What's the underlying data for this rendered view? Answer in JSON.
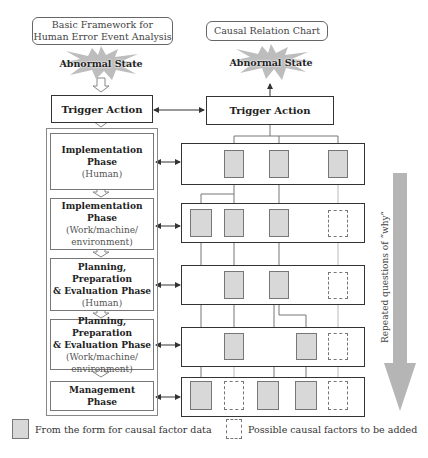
{
  "left_column": {
    "title": "Basic Framework for Human Error Event Analysis",
    "title_line1": "Basic Framework for",
    "title_line2": "Human Error Event Analysis",
    "abnormal_state": "Abnormal State",
    "trigger_action": "Trigger Action",
    "phases": [
      {
        "bold1": "Implementation",
        "bold2": "Phase",
        "normal1": "(Human)",
        "normal2": ""
      },
      {
        "bold1": "Implementation Phase",
        "bold2": "",
        "normal1": "(Work/machine/",
        "normal2": "environment)"
      },
      {
        "bold1": "Planning, Preparation",
        "bold2": "& Evaluation Phase",
        "normal1": "(Human)",
        "normal2": ""
      },
      {
        "bold1": "Planning, Preparation",
        "bold2": "& Evaluation Phase",
        "normal1": "(Work/machine/",
        "normal2": "environment)"
      },
      {
        "bold1": "Management",
        "bold2": "Phase",
        "normal1": "",
        "normal2": ""
      }
    ]
  },
  "right_column": {
    "title": "Causal Relation Chart",
    "abnormal_state": "Abnormal State",
    "trigger_action": "Trigger Action",
    "rows": [
      {
        "factors": [
          "data",
          "data",
          "data"
        ]
      },
      {
        "factors": [
          "data",
          "data",
          "data",
          "possible"
        ]
      },
      {
        "factors": [
          "data",
          "data",
          "possible"
        ]
      },
      {
        "factors": [
          "data",
          "data",
          "possible"
        ]
      },
      {
        "factors": [
          "data",
          "possible",
          "data",
          "data",
          "possible"
        ]
      }
    ]
  },
  "side_arrow": {
    "label": "Repeated questions of “why”",
    "color": "#b5b5b5"
  },
  "legend": {
    "data_label": "From the form for causal factor data",
    "possible_label": "Possible causal factors to be added",
    "data_color": "#d8d8d8"
  }
}
